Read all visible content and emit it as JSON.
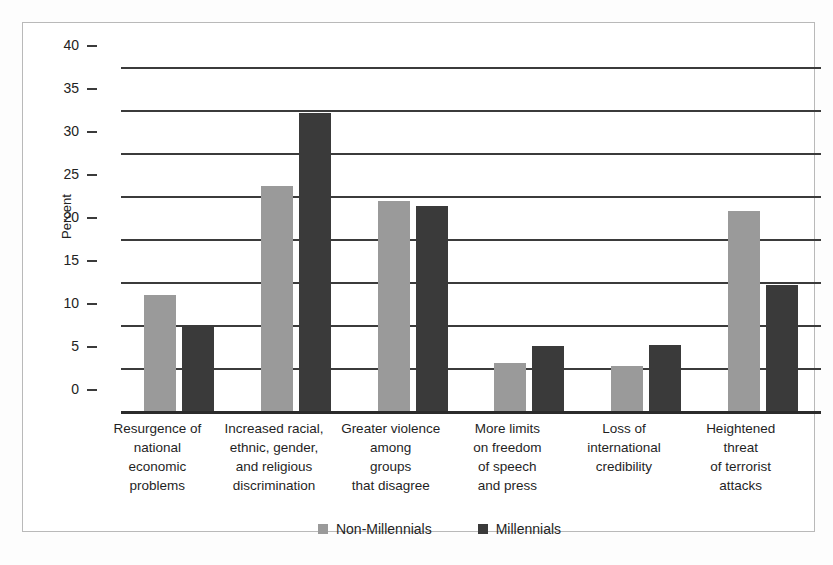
{
  "chart_data": {
    "type": "bar",
    "title": "",
    "subtitle": "",
    "xlabel": "",
    "ylabel": "Percent",
    "ylim": [
      0,
      40
    ],
    "ytick_step": 5,
    "yticks": [
      40,
      35,
      30,
      25,
      20,
      15,
      10,
      5,
      0
    ],
    "ytick_labels": [
      "40",
      "35",
      "30",
      "25",
      "20",
      "15",
      "10",
      "5",
      "0"
    ],
    "grid": true,
    "legend_position": "bottom-center",
    "categories": [
      "Resurgence of national economic problems",
      "Increased racial, ethnic, gender, and religious discrimination",
      "Greater violence among groups that disagree",
      "More limits on freedom of speech and press",
      "Loss of international credibility",
      "Heightened threat of terrorist attacks"
    ],
    "category_lines": [
      [
        "Resurgence of",
        "national",
        "economic",
        "problems"
      ],
      [
        "Increased racial,",
        "ethnic, gender,",
        "and religious",
        "discrimination"
      ],
      [
        "Greater violence",
        "among",
        "groups",
        "that disagree"
      ],
      [
        "More limits",
        "on freedom",
        "of speech",
        "and press"
      ],
      [
        "Loss of",
        "international",
        "credibility"
      ],
      [
        "Heightened",
        "threat",
        "of terrorist",
        "attacks"
      ]
    ],
    "series": [
      {
        "name": "Non-Millennials",
        "color": "#9a9a9a",
        "values": [
          13.5,
          26.2,
          24.4,
          5.6,
          5.2,
          23.3
        ]
      },
      {
        "name": "Millennials",
        "color": "#3a3a3a",
        "values": [
          10.0,
          34.7,
          23.8,
          7.6,
          7.7,
          14.7
        ]
      }
    ]
  },
  "legend": {
    "items": [
      {
        "label": "Non-Millennials",
        "swatch": "nonmill"
      },
      {
        "label": "Millennials",
        "swatch": "mill"
      }
    ]
  }
}
